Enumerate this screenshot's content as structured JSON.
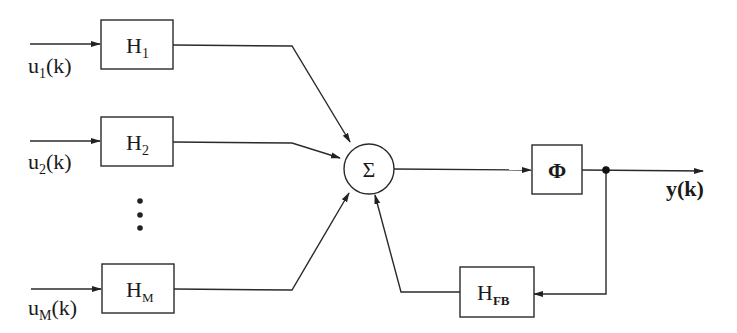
{
  "diagram": {
    "type": "block-diagram",
    "inputs": [
      {
        "id": "u1",
        "label": "u",
        "sub": "1",
        "suffix": "(k)"
      },
      {
        "id": "u2",
        "label": "u",
        "sub": "2",
        "suffix": "(k)"
      },
      {
        "id": "uM",
        "label": "u",
        "sub": "M",
        "suffix": "(k)"
      }
    ],
    "filters": [
      {
        "id": "H1",
        "label": "H",
        "sub": "1"
      },
      {
        "id": "H2",
        "label": "H",
        "sub": "2"
      },
      {
        "id": "HM",
        "label": "H",
        "sub": "M"
      }
    ],
    "ellipsis": "⋮",
    "summer": {
      "label": "Σ"
    },
    "nonlinearity": {
      "label": "Φ"
    },
    "feedback": {
      "label": "H",
      "sub": "FB"
    },
    "output": {
      "label": "y(k)"
    },
    "edges": [
      [
        "u1",
        "H1"
      ],
      [
        "u2",
        "H2"
      ],
      [
        "uM",
        "HM"
      ],
      [
        "H1",
        "Σ"
      ],
      [
        "H2",
        "Σ"
      ],
      [
        "HM",
        "Σ"
      ],
      [
        "Σ",
        "Φ"
      ],
      [
        "Φ",
        "y(k)"
      ],
      [
        "Φ",
        "HFB"
      ],
      [
        "HFB",
        "Σ"
      ]
    ]
  }
}
